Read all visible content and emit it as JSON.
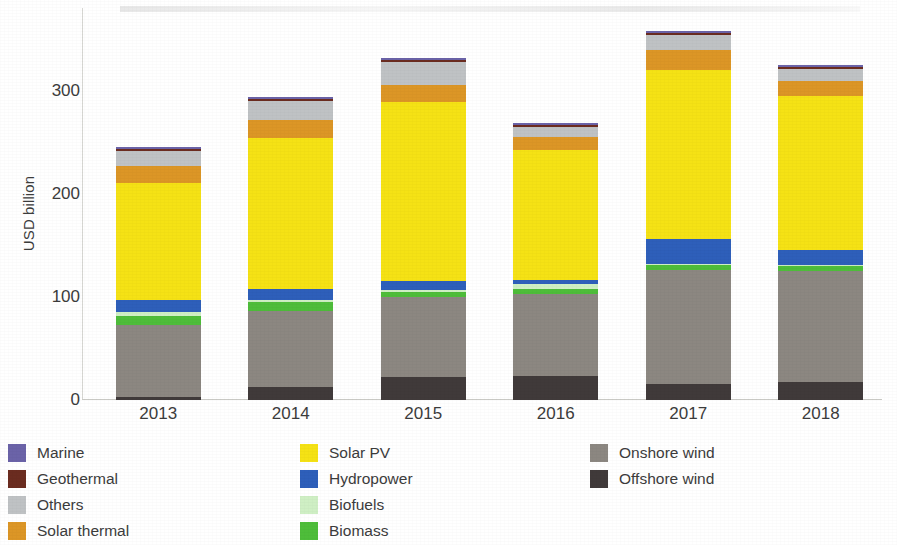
{
  "chart_data": {
    "type": "bar",
    "subtype": "stacked",
    "title": "",
    "xlabel": "",
    "ylabel": "USD billion",
    "ylim": [
      0,
      380
    ],
    "yticks": [
      0,
      100,
      200,
      300
    ],
    "ytick_labels": [
      "0",
      "100",
      "200",
      "300"
    ],
    "grid": false,
    "legend_position": "bottom",
    "categories": [
      "2013",
      "2014",
      "2015",
      "2016",
      "2017",
      "2018"
    ],
    "series": [
      {
        "name": "Offshore wind",
        "color": "#403A3A",
        "values": [
          3,
          13,
          22,
          23,
          16,
          17
        ]
      },
      {
        "name": "Onshore wind",
        "color": "#8C8781",
        "values": [
          70,
          73,
          78,
          80,
          110,
          108
        ]
      },
      {
        "name": "Biomass",
        "color": "#4EBD3A",
        "values": [
          8,
          9,
          5,
          5,
          5,
          5
        ]
      },
      {
        "name": "Biofuels",
        "color": "#CFEFC4",
        "values": [
          4,
          2,
          2,
          4,
          1,
          1
        ]
      },
      {
        "name": "Hydropower",
        "color": "#2E5FBA",
        "values": [
          12,
          11,
          8,
          4,
          24,
          14
        ]
      },
      {
        "name": "Solar PV",
        "color": "#F5E215",
        "values": [
          113,
          146,
          174,
          126,
          164,
          150
        ]
      },
      {
        "name": "Solar thermal",
        "color": "#DC9626",
        "values": [
          17,
          17,
          16,
          13,
          19,
          14
        ]
      },
      {
        "name": "Others",
        "color": "#BFC2C4",
        "values": [
          14,
          19,
          23,
          10,
          15,
          12
        ]
      },
      {
        "name": "Geothermal",
        "color": "#6B2C20",
        "values": [
          2,
          2,
          2,
          2,
          2,
          2
        ]
      },
      {
        "name": "Marine",
        "color": "#6B63A8",
        "values": [
          2,
          2,
          2,
          2,
          2,
          2
        ]
      }
    ],
    "totals": [
      245,
      294,
      332,
      269,
      358,
      325
    ]
  },
  "axis": {
    "y_title": "USD billion",
    "y_ticks": [
      "300",
      "200",
      "100",
      "0"
    ],
    "x_ticks": [
      "2013",
      "2014",
      "2015",
      "2016",
      "2017",
      "2018"
    ]
  },
  "legend": {
    "columns": [
      {
        "items": [
          {
            "label": "Marine",
            "color": "#6B63A8"
          },
          {
            "label": "Geothermal",
            "color": "#6B2C20"
          },
          {
            "label": "Others",
            "color": "#BFC2C4"
          },
          {
            "label": "Solar thermal",
            "color": "#DC9626"
          }
        ]
      },
      {
        "items": [
          {
            "label": "Solar PV",
            "color": "#F5E215"
          },
          {
            "label": "Hydropower",
            "color": "#2E5FBA"
          },
          {
            "label": "Biofuels",
            "color": "#CFEFC4"
          },
          {
            "label": "Biomass",
            "color": "#4EBD3A"
          }
        ]
      },
      {
        "items": [
          {
            "label": "Onshore wind",
            "color": "#8C8781"
          },
          {
            "label": "Offshore wind",
            "color": "#403A3A"
          }
        ]
      }
    ]
  }
}
